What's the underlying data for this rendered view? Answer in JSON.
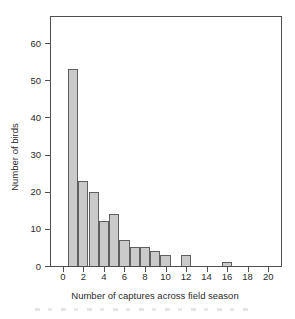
{
  "figure": {
    "background": "#ffffff",
    "axis_color": "#4f4f4f",
    "text_color": "#2b2b2b"
  },
  "chart_data": {
    "type": "bar",
    "title": "",
    "xlabel": "Number of captures across field season",
    "ylabel": "Number of birds",
    "x": [
      1,
      2,
      3,
      4,
      5,
      6,
      7,
      8,
      9,
      10,
      11,
      12,
      13,
      14,
      15,
      16,
      17,
      18,
      19,
      20
    ],
    "values": [
      53,
      23,
      20,
      12,
      14,
      7,
      5,
      5,
      4,
      3,
      0,
      3,
      0,
      0,
      0,
      1,
      0,
      0,
      0,
      0
    ],
    "bar_width": 1,
    "xticks": [
      0,
      2,
      4,
      6,
      8,
      10,
      12,
      14,
      16,
      18,
      20
    ],
    "yticks": [
      0,
      10,
      20,
      30,
      40,
      50,
      60
    ],
    "xlim": [
      -1.15,
      21.25
    ],
    "ylim": [
      0,
      67
    ],
    "grid": false,
    "legend": null,
    "bar_fill": "#cacaca",
    "bar_border": "#5f5f5f"
  }
}
